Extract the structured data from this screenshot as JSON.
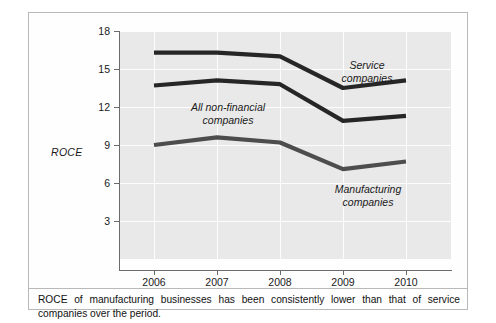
{
  "figure": {
    "caption": "ROCE of manufacturing businesses has been consistently lower than that of service companies over the period."
  },
  "chart_data": {
    "type": "line",
    "title": "",
    "xlabel": "",
    "ylabel": "ROCE",
    "categories": [
      "2006",
      "2007",
      "2008",
      "2009",
      "2010"
    ],
    "x": [
      2006,
      2007,
      2008,
      2009,
      2010
    ],
    "ylim": [
      0,
      18
    ],
    "yticks": [
      3,
      6,
      9,
      12,
      15,
      18
    ],
    "ytick_labels": [
      "3",
      "6",
      "9",
      "12",
      "15",
      "18"
    ],
    "grid": true,
    "legend_position": "inline-annotations",
    "series": [
      {
        "name": "Service companies",
        "label_line1": "Service",
        "label_line2": "companies",
        "color": "#262626",
        "values": [
          16.3,
          16.3,
          16.0,
          13.5,
          14.1
        ]
      },
      {
        "name": "All non-financial companies",
        "label_line1": "All non-financial",
        "label_line2": "companies",
        "color": "#262626",
        "values": [
          13.7,
          14.1,
          13.8,
          10.9,
          11.3
        ]
      },
      {
        "name": "Manufacturing companies",
        "label_line1": "Manufacturing",
        "label_line2": "companies",
        "color": "#4d4d4d",
        "values": [
          9.0,
          9.6,
          9.2,
          7.1,
          7.7
        ]
      }
    ],
    "plot_background": "#e9e9e9",
    "gridline_color": "#fdfdfd",
    "axis_color": "#6b6b6b"
  }
}
